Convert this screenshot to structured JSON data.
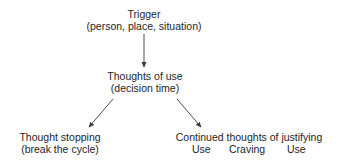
{
  "diagram": {
    "colors": {
      "text": "#1e1e1e",
      "arrow": "#3a3a3a",
      "background": "#ffffff"
    },
    "nodes": {
      "trigger": {
        "title": "Trigger",
        "subtitle": "(person, place, situation)"
      },
      "thoughts_of_use": {
        "title": "Thoughts of use",
        "subtitle": "(decision time)"
      },
      "thought_stopping": {
        "title": "Thought stopping",
        "subtitle": "(break the cycle)"
      },
      "continued_thoughts": {
        "title": "Continued thoughts of justifying",
        "cycle_items": [
          "Use",
          "Craving",
          "Use"
        ]
      }
    },
    "edges": [
      {
        "from": "trigger",
        "to": "thoughts_of_use"
      },
      {
        "from": "thoughts_of_use",
        "to": "thought_stopping"
      },
      {
        "from": "thoughts_of_use",
        "to": "continued_thoughts"
      }
    ]
  }
}
